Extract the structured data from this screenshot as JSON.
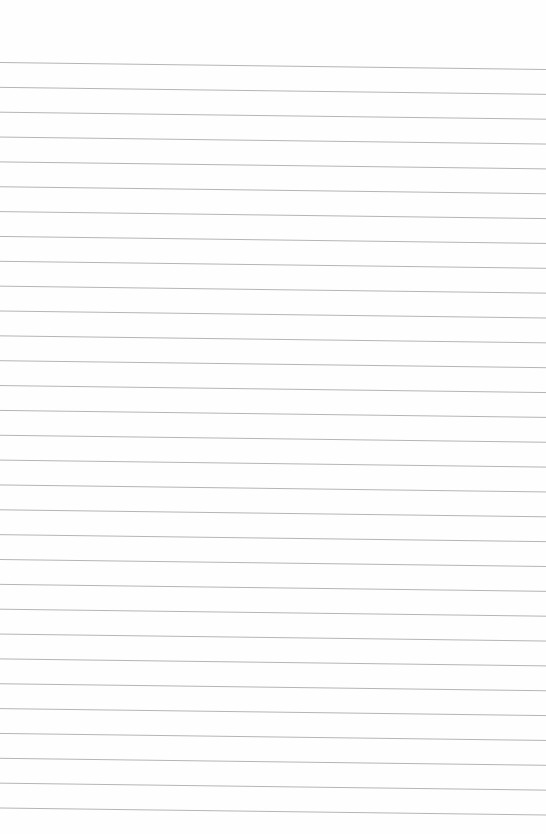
{
  "page": {
    "type": "ruled-paper",
    "background": "#fefefe",
    "line_color": "#b5b5b5",
    "line_count": 31,
    "first_line_left_y": 62.5,
    "first_line_right_y": 69.5,
    "line_spacing": 24.85,
    "width": 546,
    "height": 834
  },
  "bleed_text": ""
}
